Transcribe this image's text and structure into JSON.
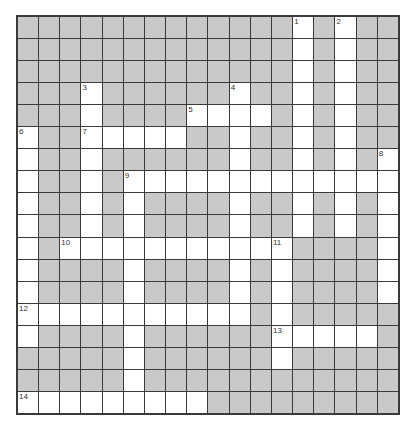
{
  "puzzle": {
    "rows": 18,
    "cols": 18,
    "colors": {
      "block": "#c9c9c9",
      "open": "#ffffff",
      "line": "#3a3a3a"
    },
    "open_cells": [
      [
        0,
        13
      ],
      [
        0,
        15
      ],
      [
        1,
        13
      ],
      [
        1,
        15
      ],
      [
        2,
        13
      ],
      [
        2,
        15
      ],
      [
        3,
        3
      ],
      [
        3,
        10
      ],
      [
        3,
        13
      ],
      [
        3,
        15
      ],
      [
        4,
        3
      ],
      [
        4,
        8
      ],
      [
        4,
        9
      ],
      [
        4,
        10
      ],
      [
        4,
        11
      ],
      [
        4,
        13
      ],
      [
        4,
        15
      ],
      [
        5,
        0
      ],
      [
        5,
        3
      ],
      [
        5,
        4
      ],
      [
        5,
        5
      ],
      [
        5,
        6
      ],
      [
        5,
        7
      ],
      [
        5,
        10
      ],
      [
        5,
        13
      ],
      [
        5,
        15
      ],
      [
        6,
        0
      ],
      [
        6,
        3
      ],
      [
        6,
        10
      ],
      [
        6,
        13
      ],
      [
        6,
        15
      ],
      [
        6,
        17
      ],
      [
        7,
        0
      ],
      [
        7,
        3
      ],
      [
        7,
        5
      ],
      [
        7,
        6
      ],
      [
        7,
        7
      ],
      [
        7,
        8
      ],
      [
        7,
        9
      ],
      [
        7,
        10
      ],
      [
        7,
        11
      ],
      [
        7,
        12
      ],
      [
        7,
        13
      ],
      [
        7,
        14
      ],
      [
        7,
        15
      ],
      [
        7,
        16
      ],
      [
        7,
        17
      ],
      [
        8,
        0
      ],
      [
        8,
        3
      ],
      [
        8,
        5
      ],
      [
        8,
        10
      ],
      [
        8,
        13
      ],
      [
        8,
        15
      ],
      [
        8,
        17
      ],
      [
        9,
        0
      ],
      [
        9,
        3
      ],
      [
        9,
        5
      ],
      [
        9,
        10
      ],
      [
        9,
        13
      ],
      [
        9,
        15
      ],
      [
        9,
        17
      ],
      [
        10,
        0
      ],
      [
        10,
        2
      ],
      [
        10,
        3
      ],
      [
        10,
        4
      ],
      [
        10,
        5
      ],
      [
        10,
        6
      ],
      [
        10,
        7
      ],
      [
        10,
        8
      ],
      [
        10,
        9
      ],
      [
        10,
        10
      ],
      [
        10,
        11
      ],
      [
        10,
        12
      ],
      [
        10,
        17
      ],
      [
        11,
        0
      ],
      [
        11,
        5
      ],
      [
        11,
        10
      ],
      [
        11,
        12
      ],
      [
        11,
        17
      ],
      [
        12,
        0
      ],
      [
        12,
        5
      ],
      [
        12,
        10
      ],
      [
        12,
        12
      ],
      [
        12,
        17
      ],
      [
        13,
        0
      ],
      [
        13,
        1
      ],
      [
        13,
        2
      ],
      [
        13,
        3
      ],
      [
        13,
        4
      ],
      [
        13,
        5
      ],
      [
        13,
        6
      ],
      [
        13,
        7
      ],
      [
        13,
        8
      ],
      [
        13,
        9
      ],
      [
        13,
        10
      ],
      [
        13,
        12
      ],
      [
        14,
        0
      ],
      [
        14,
        5
      ],
      [
        14,
        12
      ],
      [
        14,
        13
      ],
      [
        14,
        14
      ],
      [
        14,
        15
      ],
      [
        14,
        16
      ],
      [
        15,
        5
      ],
      [
        15,
        12
      ],
      [
        16,
        5
      ],
      [
        17,
        0
      ],
      [
        17,
        1
      ],
      [
        17,
        2
      ],
      [
        17,
        3
      ],
      [
        17,
        4
      ],
      [
        17,
        5
      ],
      [
        17,
        6
      ],
      [
        17,
        7
      ],
      [
        17,
        8
      ]
    ],
    "numbers": [
      {
        "r": 0,
        "c": 13,
        "n": "1"
      },
      {
        "r": 0,
        "c": 15,
        "n": "2"
      },
      {
        "r": 3,
        "c": 3,
        "n": "3"
      },
      {
        "r": 3,
        "c": 10,
        "n": "4"
      },
      {
        "r": 4,
        "c": 8,
        "n": "5"
      },
      {
        "r": 5,
        "c": 0,
        "n": "6"
      },
      {
        "r": 5,
        "c": 3,
        "n": "7"
      },
      {
        "r": 6,
        "c": 17,
        "n": "8"
      },
      {
        "r": 7,
        "c": 5,
        "n": "9"
      },
      {
        "r": 10,
        "c": 2,
        "n": "10"
      },
      {
        "r": 10,
        "c": 12,
        "n": "11"
      },
      {
        "r": 13,
        "c": 0,
        "n": "12"
      },
      {
        "r": 14,
        "c": 12,
        "n": "13"
      },
      {
        "r": 17,
        "c": 0,
        "n": "14"
      }
    ]
  }
}
